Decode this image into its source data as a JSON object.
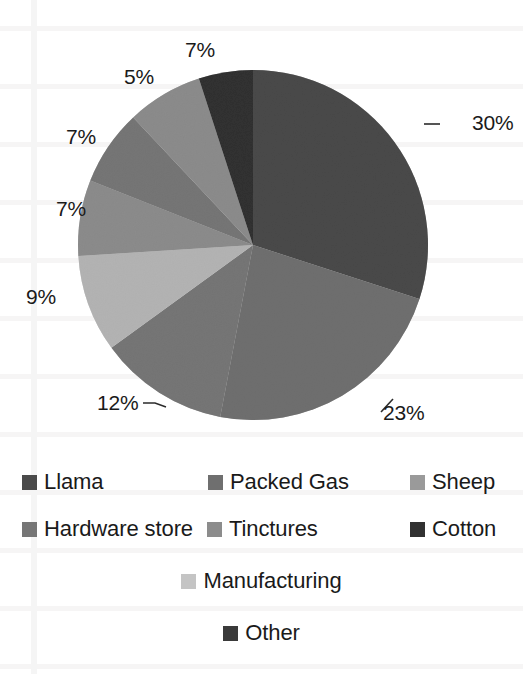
{
  "chart_data": {
    "type": "pie",
    "title": "",
    "subtitle": "",
    "xlabel": "",
    "ylabel": "",
    "legend_position": "bottom",
    "grid": false,
    "units": "percent",
    "categories": [
      "Llama",
      "Packed Gas",
      "Sheep",
      "Hardware store",
      "Tinctures",
      "Cotton",
      "Manufacturing",
      "Other"
    ],
    "values": [
      30,
      23,
      12,
      9,
      7,
      7,
      7,
      5
    ],
    "data_labels": [
      "30%",
      "23%",
      "12%",
      "9%",
      "7%",
      "7%",
      "7%",
      "5%"
    ],
    "colors": [
      "#4a4a4a",
      "#6f6f6f",
      "#767676",
      "#b4b4b4",
      "#8c8c8c",
      "#313131",
      "#c4c4c4",
      "#3a3a3a"
    ],
    "slices": [
      {
        "label": "Llama",
        "value": 30,
        "data_label": "30%",
        "color": "#4a4a4a",
        "start_deg": 0,
        "end_deg": 108
      },
      {
        "label": "Packed Gas",
        "value": 23,
        "data_label": "23%",
        "color": "#6f6f6f",
        "start_deg": 108,
        "end_deg": 190.8
      },
      {
        "label": "Sheep",
        "value": 12,
        "data_label": "12%",
        "color": "#767676",
        "start_deg": 190.8,
        "end_deg": 234
      },
      {
        "label": "Hardware store",
        "value": 9,
        "data_label": "9%",
        "color": "#b4b4b4",
        "start_deg": 234,
        "end_deg": 266.4
      },
      {
        "label": "Tinctures",
        "value": 7,
        "data_label": "7%",
        "color": "#8c8c8c",
        "start_deg": 266.4,
        "end_deg": 291.6
      },
      {
        "label": "Cotton",
        "value": 7,
        "data_label": "7%",
        "color": "#767676",
        "start_deg": 291.6,
        "end_deg": 316.8
      },
      {
        "label": "Manufacturing",
        "value": 7,
        "data_label": "7%",
        "color": "#8c8c8c",
        "start_deg": 316.8,
        "end_deg": 342
      },
      {
        "label": "Other",
        "value": 5,
        "data_label": "5%",
        "color": "#313131",
        "start_deg": 342,
        "end_deg": 360
      }
    ]
  },
  "pie": {
    "center_x": 253,
    "center_y": 245,
    "radius": 175,
    "labels": {
      "llama": "30%",
      "packed_gas": "23%",
      "sheep": "12%",
      "hardware_store": "9%",
      "tinctures": "7%",
      "cotton": "7%",
      "manufacturing": "7%",
      "other": "5%"
    }
  },
  "legend": {
    "rows": [
      {
        "items": [
          {
            "label": "Llama",
            "color": "#4a4a4a"
          },
          {
            "label": "Packed Gas",
            "color": "#6f6f6f"
          },
          {
            "label": "Sheep",
            "color": "#9a9a9a"
          }
        ]
      },
      {
        "items": [
          {
            "label": "Hardware store",
            "color": "#767676"
          },
          {
            "label": "Tinctures",
            "color": "#8c8c8c"
          },
          {
            "label": "Cotton",
            "color": "#313131"
          }
        ]
      },
      {
        "items": [
          {
            "label": "Manufacturing",
            "color": "#c4c4c4"
          }
        ]
      },
      {
        "items": [
          {
            "label": "Other",
            "color": "#3a3a3a"
          }
        ]
      }
    ]
  }
}
